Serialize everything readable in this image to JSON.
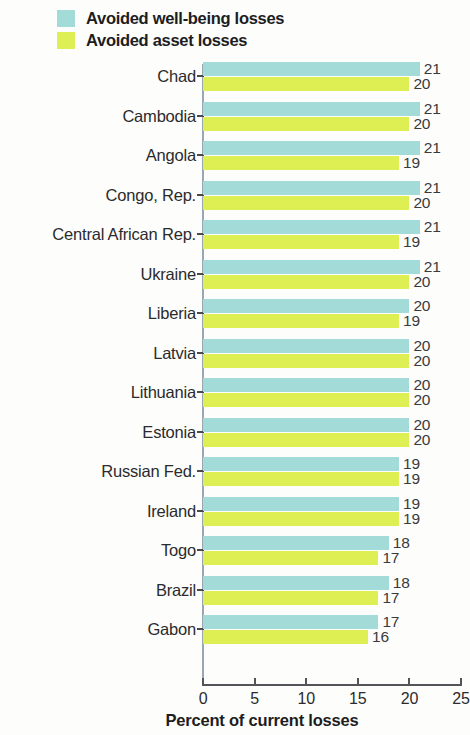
{
  "legend": {
    "items": [
      {
        "label": "Avoided well-being losses",
        "color": "#a2dbd8",
        "swatch_name": "legend-swatch-wellbeing"
      },
      {
        "label": "Avoided asset losses",
        "color": "#ddef52",
        "swatch_name": "legend-swatch-asset"
      }
    ]
  },
  "axis": {
    "title": "Percent of current losses",
    "ticks": [
      "0",
      "5",
      "10",
      "15",
      "20",
      "25"
    ]
  },
  "chart_data": {
    "type": "bar",
    "orientation": "horizontal",
    "title": "",
    "subtitle": "",
    "xlabel": "Percent of current losses",
    "ylabel": "",
    "xlim": [
      0,
      25
    ],
    "xticks": [
      0,
      5,
      10,
      15,
      20,
      25
    ],
    "grid": false,
    "legend_position": "top-left",
    "categories": [
      "Chad",
      "Cambodia",
      "Angola",
      "Congo, Rep.",
      "Central African Rep.",
      "Ukraine",
      "Liberia",
      "Latvia",
      "Lithuania",
      "Estonia",
      "Russian Fed.",
      "Ireland",
      "Togo",
      "Brazil",
      "Gabon"
    ],
    "series": [
      {
        "name": "Avoided well-being losses",
        "color": "#a2dbd8",
        "values": [
          21,
          21,
          21,
          21,
          21,
          21,
          20,
          20,
          20,
          20,
          19,
          19,
          18,
          18,
          17
        ]
      },
      {
        "name": "Avoided asset losses",
        "color": "#ddef52",
        "values": [
          20,
          20,
          19,
          20,
          19,
          20,
          19,
          20,
          20,
          20,
          19,
          19,
          17,
          17,
          16
        ]
      }
    ]
  }
}
